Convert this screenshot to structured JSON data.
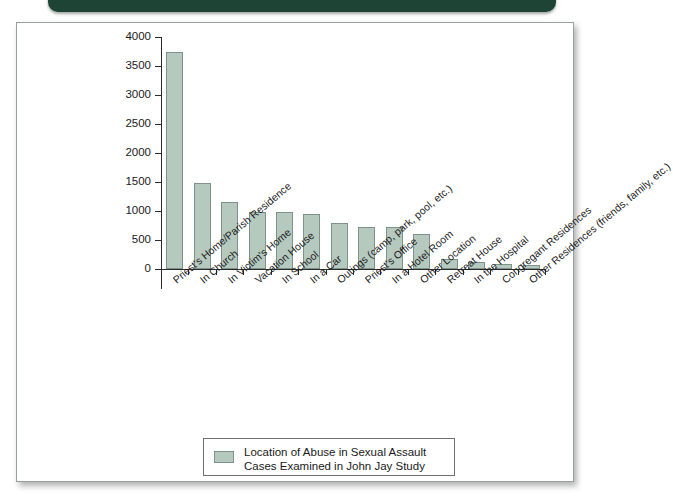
{
  "banner": {
    "color": "#1d4434"
  },
  "panel": {
    "background": "#ffffff",
    "border_color": "#9aa0a2"
  },
  "legend": {
    "swatch_color": "#b6c9bf",
    "swatch_border": "#7d9289",
    "line1": "Location of Abuse in Sexual Assault",
    "line2": "Cases Examined in John Jay Study"
  },
  "chart_data": {
    "type": "bar",
    "title": "",
    "xlabel": "",
    "ylabel": "",
    "ylim": [
      0,
      4000
    ],
    "ytick_step": 500,
    "yticks": [
      0,
      500,
      1000,
      1500,
      2000,
      2500,
      3000,
      3500,
      4000
    ],
    "ytick_labels": [
      "0",
      "500",
      "1000",
      "1500",
      "2000",
      "2500",
      "3000",
      "3500",
      "4000"
    ],
    "grid": false,
    "legend_position": "bottom-center",
    "bar_color": "#b6c9bf",
    "bar_edge_color": "#7d9289",
    "series_name": "Location of Abuse in Sexual Assault Cases Examined in John Jay Study",
    "categories": [
      "Priest's Home/Parish Residence",
      "In Church",
      "In Victim's Home",
      "Vacation House",
      "In School",
      "In a Car",
      "Outings (camp, park, pool, etc.)",
      "Priest's Office",
      "In a Hotel Room",
      "Other Location",
      "Retreat House",
      "In the Hospital",
      "Congregant Residences",
      "Other Residences (friends, family, etc.)"
    ],
    "values": [
      3750,
      1480,
      1150,
      980,
      990,
      940,
      800,
      720,
      720,
      610,
      170,
      120,
      80,
      75
    ]
  }
}
